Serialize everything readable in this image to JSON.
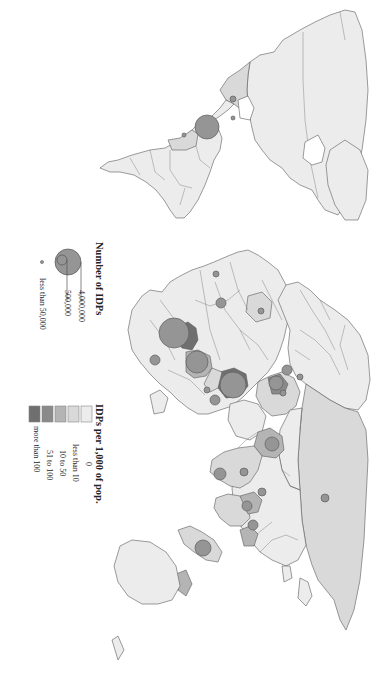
{
  "figure": {
    "type": "map",
    "orientation": "rotated 90° clockwise (north points right)",
    "theme": "Internally displaced persons (IDPs) worldwide"
  },
  "colors": {
    "background": "#ffffff",
    "class_0": "#ececec",
    "class_lt10": "#d9d9d9",
    "class_10_50": "#b4b4b4",
    "class_51_100": "#8a8a8a",
    "class_gt100": "#6f6f6f",
    "bubble_fill": "#959595",
    "outline": "#5a5a5a"
  },
  "legend_size": {
    "title": "Number of IDPs",
    "items": [
      {
        "label": "4,000,000",
        "value": 4000000
      },
      {
        "label": "500,000",
        "value": 500000
      },
      {
        "label": "less than 50,000",
        "value": 50000
      }
    ]
  },
  "legend_color": {
    "title": "IDPs per 1,000 of pop.",
    "items": [
      {
        "label": "0",
        "color": "#ececec"
      },
      {
        "label": "less than 10",
        "color": "#d9d9d9"
      },
      {
        "label": "10 to 50",
        "color": "#b4b4b4"
      },
      {
        "label": "51 to 100",
        "color": "#8a8a8a"
      },
      {
        "label": "more than 100",
        "color": "#6f6f6f"
      }
    ]
  },
  "chart_data": {
    "type": "map",
    "title": "",
    "legends": [
      {
        "title": "Number of IDPs",
        "kind": "proportional-circle",
        "entries": [
          "4,000,000",
          "500,000",
          "less than 50,000"
        ]
      },
      {
        "title": "IDPs per 1,000 of pop.",
        "kind": "choropleth",
        "entries": [
          "0",
          "less than 10",
          "10 to 50",
          "51 to 100",
          "more than 100"
        ]
      }
    ],
    "bubbles_approx": [
      {
        "region": "Colombia",
        "size": "large (~3,000,000)",
        "x": 207,
        "y": 127,
        "r": 12
      },
      {
        "region": "Mexico",
        "size": "small",
        "x": 233,
        "y": 118,
        "r": 2
      },
      {
        "region": "Guatemala",
        "size": "small",
        "x": 233,
        "y": 99,
        "r": 3
      },
      {
        "region": "Peru",
        "size": "small",
        "x": 184,
        "y": 135,
        "r": 2
      },
      {
        "region": "Sudan",
        "size": "large (~4,000,000)",
        "x": 174,
        "y": 333,
        "r": 15
      },
      {
        "region": "DR Congo",
        "size": "large (~1,500,000)",
        "x": 197,
        "y": 362,
        "r": 11
      },
      {
        "region": "Uganda",
        "size": "large (~1,700,000)",
        "x": 233,
        "y": 385,
        "r": 13
      },
      {
        "region": "Somalia",
        "size": "medium",
        "x": 215,
        "y": 400,
        "r": 5
      },
      {
        "region": "Iraq",
        "size": "medium",
        "x": 276,
        "y": 383,
        "r": 7
      },
      {
        "region": "Turkey",
        "size": "medium",
        "x": 287,
        "y": 370,
        "r": 5
      },
      {
        "region": "Afghanistan",
        "size": "medium",
        "x": 272,
        "y": 444,
        "r": 7
      },
      {
        "region": "India",
        "size": "medium",
        "x": 244,
        "y": 472,
        "r": 4
      },
      {
        "region": "Sri Lanka",
        "size": "medium",
        "x": 220,
        "y": 474,
        "r": 6
      },
      {
        "region": "Myanmar",
        "size": "medium",
        "x": 247,
        "y": 506,
        "r": 5
      },
      {
        "region": "Bangladesh",
        "size": "medium",
        "x": 262,
        "y": 492,
        "r": 4
      },
      {
        "region": "Indonesia",
        "size": "large",
        "x": 203,
        "y": 548,
        "r": 8
      },
      {
        "region": "Philippines",
        "size": "medium",
        "x": 253,
        "y": 525,
        "r": 5
      },
      {
        "region": "Russia",
        "size": "small",
        "x": 325,
        "y": 498,
        "r": 4
      },
      {
        "region": "Nigeria",
        "size": "medium",
        "x": 221,
        "y": 303,
        "r": 5
      },
      {
        "region": "Côte d'Ivoire",
        "size": "small",
        "x": 216,
        "y": 274,
        "r": 3
      },
      {
        "region": "Algeria",
        "size": "small",
        "x": 261,
        "y": 311,
        "r": 3
      },
      {
        "region": "Kenya",
        "size": "small",
        "x": 207,
        "y": 390,
        "r": 3
      },
      {
        "region": "Zimbabwe",
        "size": "medium",
        "x": 155,
        "y": 360,
        "r": 5
      },
      {
        "region": "Georgia/Azerbaijan",
        "size": "small",
        "x": 300,
        "y": 377,
        "r": 3
      },
      {
        "region": "Lebanon",
        "size": "small",
        "x": 283,
        "y": 393,
        "r": 3
      }
    ]
  }
}
